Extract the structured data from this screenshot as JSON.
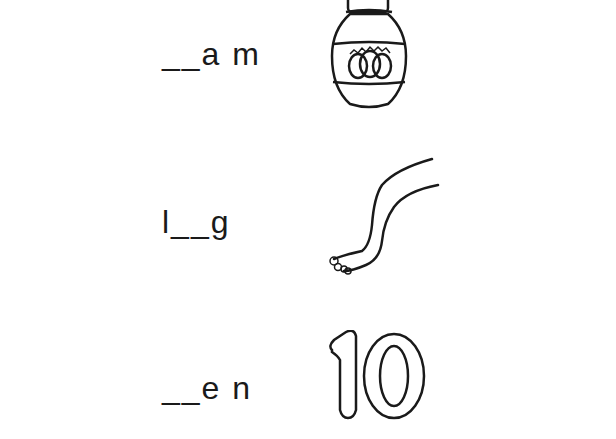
{
  "worksheet": {
    "items": [
      {
        "word_prompt": "__a m",
        "picture": "jar-of-jam",
        "answer_hidden": true
      },
      {
        "word_prompt": "l__g",
        "picture": "leg",
        "answer_hidden": true
      },
      {
        "word_prompt": "__e n",
        "picture": "number-ten",
        "answer_hidden": true
      }
    ]
  },
  "colors": {
    "ink": "#1a1a1a",
    "background": "#ffffff"
  }
}
